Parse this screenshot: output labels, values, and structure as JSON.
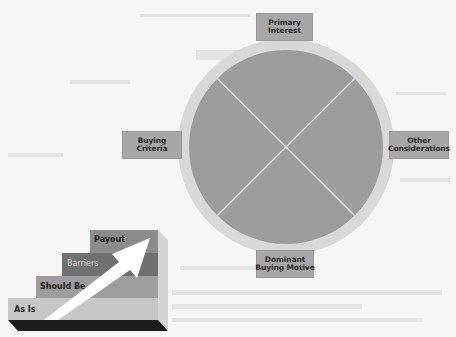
{
  "diagram": {
    "wheel": {
      "center": [
        286,
        147
      ],
      "outer_radius": 108,
      "inner_radius": 97,
      "ring_color": "#d8d8d8",
      "disc_color": "#9c9c9c",
      "divider_color": "#e8e8e8"
    },
    "labels": {
      "top": {
        "line1": "Primary",
        "line2": "Interest"
      },
      "left": {
        "line1": "Buying",
        "line2": "Criteria"
      },
      "right": {
        "line1": "Other",
        "line2": "Considerations"
      },
      "bottom": {
        "line1": "Dominant",
        "line2": "Buying Motive"
      }
    },
    "label_box_color": "#a7a7a7",
    "staircase": {
      "steps": [
        {
          "label": "As Is",
          "color": "#c6c6c6",
          "text_color": "#2a2a2a"
        },
        {
          "label": "Should Be",
          "color": "#9d9d9d",
          "text_color": "#222222"
        },
        {
          "label": "Barriers",
          "color": "#707070",
          "text_color": "#d9d9d9"
        },
        {
          "label": "Payout",
          "color": "#8c8c8c",
          "text_color": "#1e1e1e"
        }
      ],
      "base_color": "#1c1c1c",
      "side_color": "#d4d4d4",
      "arrow_color": "#ffffff"
    }
  }
}
